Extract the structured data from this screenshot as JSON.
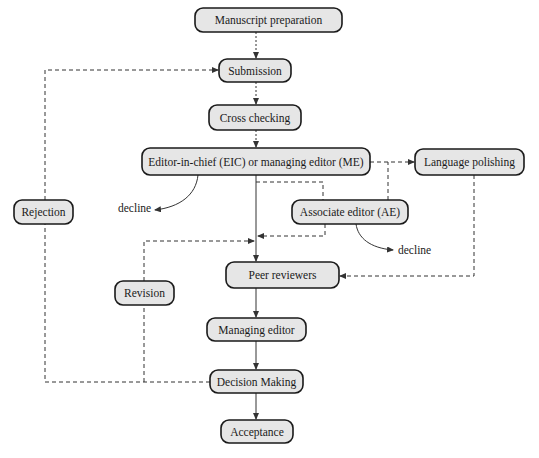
{
  "diagram": {
    "title": "",
    "nodes": {
      "manuscript_preparation": "Manuscript preparation",
      "submission": "Submission",
      "cross_checking": "Cross checking",
      "eic_me": "Editor-in-chief (EIC) or managing editor (ME)",
      "language_polishing": "Language polishing",
      "associate_editor": "Associate editor (AE)",
      "rejection": "Rejection",
      "peer_reviewers": "Peer reviewers",
      "revision": "Revision",
      "managing_editor": "Managing editor",
      "decision_making": "Decision Making",
      "acceptance": "Acceptance"
    },
    "labels": {
      "decline_eic": "decline",
      "decline_ae": "decline"
    },
    "edges": [
      {
        "from": "Manuscript preparation",
        "to": "Submission",
        "style": "dotted"
      },
      {
        "from": "Submission",
        "to": "Cross checking",
        "style": "dotted"
      },
      {
        "from": "Cross checking",
        "to": "Editor-in-chief (EIC) or managing editor (ME)",
        "style": "dotted"
      },
      {
        "from": "Editor-in-chief (EIC) or managing editor (ME)",
        "to": "Language polishing",
        "style": "dashed"
      },
      {
        "from": "Editor-in-chief (EIC) or managing editor (ME)",
        "to": "decline",
        "style": "curved"
      },
      {
        "from": "Editor-in-chief (EIC) or managing editor (ME)",
        "to": "Associate editor (AE)",
        "style": "dashed"
      },
      {
        "from": "Editor-in-chief (EIC) or managing editor (ME)",
        "to": "Peer reviewers",
        "style": "solid"
      },
      {
        "from": "Associate editor (AE)",
        "to": "Language polishing",
        "style": "dashed"
      },
      {
        "from": "Associate editor (AE)",
        "to": "Peer reviewers",
        "style": "dashed"
      },
      {
        "from": "Associate editor (AE)",
        "to": "decline",
        "style": "curved"
      },
      {
        "from": "Language polishing",
        "to": "Peer reviewers",
        "style": "dashed"
      },
      {
        "from": "Peer reviewers",
        "to": "Managing editor",
        "style": "solid"
      },
      {
        "from": "Managing editor",
        "to": "Decision Making",
        "style": "solid"
      },
      {
        "from": "Decision Making",
        "to": "Acceptance",
        "style": "solid"
      },
      {
        "from": "Decision Making",
        "to": "Revision",
        "style": "dashed"
      },
      {
        "from": "Revision",
        "to": "Peer reviewers",
        "style": "dashed"
      },
      {
        "from": "Decision Making",
        "to": "Rejection",
        "style": "dashed"
      },
      {
        "from": "Rejection",
        "to": "Submission",
        "style": "dashed"
      }
    ]
  }
}
